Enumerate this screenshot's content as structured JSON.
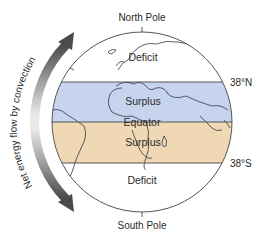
{
  "diagram": {
    "type": "earth-energy-budget",
    "labels": {
      "north_pole": "North Pole",
      "south_pole": "South Pole",
      "lat_north": "38°N",
      "lat_south": "38°S",
      "deficit_north": "Deficit",
      "surplus_north": "Surplus",
      "equator": "Equator",
      "surplus_south": "Surplus",
      "deficit_south": "Deficit",
      "arrow_caption": "Net energy flow by convection"
    },
    "zones": [
      {
        "name": "Deficit",
        "from": "North Pole",
        "to": "38°N",
        "color": "#ffffff"
      },
      {
        "name": "Surplus",
        "from": "38°N",
        "to": "Equator",
        "color": "#c6d4ee"
      },
      {
        "name": "Surplus",
        "from": "Equator",
        "to": "38°S",
        "color": "#f1d8b4"
      },
      {
        "name": "Deficit",
        "from": "38°S",
        "to": "South Pole",
        "color": "#ffffff"
      }
    ],
    "colors": {
      "surplus_north_band": "#c6d4ee",
      "surplus_south_band": "#f1d8b4",
      "outline": "#555555",
      "coastline": "#2f3a4a",
      "arrow_dark": "#4a4a4a",
      "arrow_light": "#e6e6e6"
    }
  }
}
